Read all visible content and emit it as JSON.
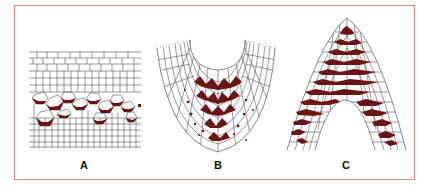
{
  "figure": {
    "panels": [
      {
        "id": "A",
        "label": "A",
        "shape": "tissue-layer-section"
      },
      {
        "id": "B",
        "label": "B",
        "shape": "u-shaped-section"
      },
      {
        "id": "C",
        "label": "C",
        "shape": "arch-shaped-section"
      }
    ],
    "colors": {
      "frame": "#d98c8c",
      "cell_outline": "#555555",
      "stain": "#6b1414"
    }
  }
}
